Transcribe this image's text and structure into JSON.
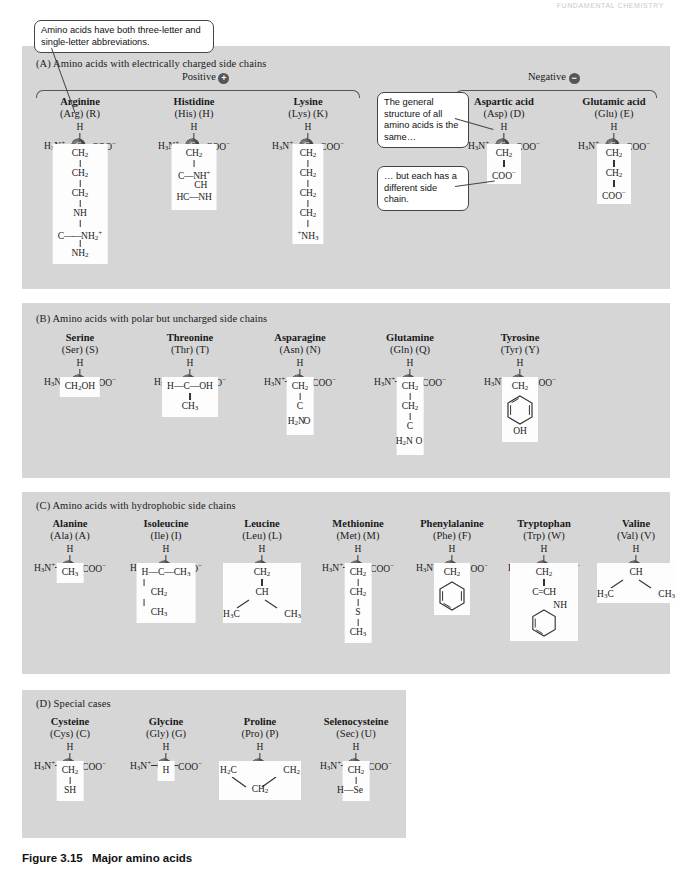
{
  "header": {
    "running_head": "FUNDAMENTAL CHEMISTRY"
  },
  "caption": {
    "label": "Figure 3.15",
    "title": "Major amino acids"
  },
  "callouts": [
    {
      "id": "abbrev-callout",
      "text": "Amino acids have both three-letter and single-letter abbreviations."
    },
    {
      "id": "general-structure-callout",
      "text": "The general structure of all amino acids is the same…"
    },
    {
      "id": "side-chain-callout",
      "text": "… but each has a different side chain."
    }
  ],
  "sections": [
    {
      "id": "A",
      "label": "(A)  Amino acids with electrically charged side chains",
      "charge_groups": [
        {
          "label": "Positive",
          "symbol": "+"
        },
        {
          "label": "Negative",
          "symbol": "−"
        }
      ],
      "amino_acids": [
        {
          "name": "Arginine",
          "three": "(Arg)",
          "one": "(R)",
          "amino": "H3N+",
          "carboxyl": "COO-",
          "side_chain": [
            "CH2",
            "CH2",
            "CH2",
            "NH",
            "C=NH2+",
            "NH2"
          ]
        },
        {
          "name": "Histidine",
          "three": "(His)",
          "one": "(H)",
          "amino": "H3N+",
          "carboxyl": "COO-",
          "side_chain": [
            "CH2",
            "C—NH+",
            "CH",
            "HC—NH"
          ]
        },
        {
          "name": "Lysine",
          "three": "(Lys)",
          "one": "(K)",
          "amino": "H3N+",
          "carboxyl": "COO-",
          "side_chain": [
            "CH2",
            "CH2",
            "CH2",
            "CH2",
            "+NH3"
          ]
        },
        {
          "name": "Aspartic acid",
          "three": "(Asp)",
          "one": "(D)",
          "amino": "H3N+",
          "carboxyl": "COO-",
          "side_chain": [
            "CH2",
            "COO-"
          ]
        },
        {
          "name": "Glutamic acid",
          "three": "(Glu)",
          "one": "(E)",
          "amino": "H3N+",
          "carboxyl": "COO-",
          "side_chain": [
            "CH2",
            "CH2",
            "COO-"
          ]
        }
      ]
    },
    {
      "id": "B",
      "label": "(B)  Amino acids with polar but uncharged side chains",
      "amino_acids": [
        {
          "name": "Serine",
          "three": "(Ser)",
          "one": "(S)",
          "amino": "H3N+",
          "carboxyl": "COO-",
          "side_chain": [
            "CH2OH"
          ]
        },
        {
          "name": "Threonine",
          "three": "(Thr)",
          "one": "(T)",
          "amino": "H3N+",
          "carboxyl": "COO-",
          "side_chain": [
            "H—C—OH",
            "CH3"
          ]
        },
        {
          "name": "Asparagine",
          "three": "(Asn)",
          "one": "(N)",
          "amino": "H3N+",
          "carboxyl": "COO-",
          "side_chain": [
            "CH2",
            "C",
            "H2N",
            "O"
          ]
        },
        {
          "name": "Glutamine",
          "three": "(Gln)",
          "one": "(Q)",
          "amino": "H3N+",
          "carboxyl": "COO-",
          "side_chain": [
            "CH2",
            "CH2",
            "C",
            "H2N",
            "O"
          ]
        },
        {
          "name": "Tyrosine",
          "three": "(Tyr)",
          "one": "(Y)",
          "amino": "H3N+",
          "carboxyl": "COO-",
          "side_chain": [
            "CH2",
            "benzene-ring",
            "OH"
          ]
        }
      ]
    },
    {
      "id": "C",
      "label": "(C)  Amino acids with hydrophobic side chains",
      "amino_acids": [
        {
          "name": "Alanine",
          "three": "(Ala)",
          "one": "(A)",
          "amino": "H3N+",
          "carboxyl": "COO-",
          "side_chain": [
            "CH3"
          ]
        },
        {
          "name": "Isoleucine",
          "three": "(Ile)",
          "one": "(I)",
          "amino": "H3N+",
          "carboxyl": "COO-",
          "side_chain": [
            "H—C—CH3",
            "CH2",
            "CH3"
          ]
        },
        {
          "name": "Leucine",
          "three": "(Leu)",
          "one": "(L)",
          "amino": "H3N+",
          "carboxyl": "COO-",
          "side_chain": [
            "CH2",
            "CH",
            "H3C",
            "CH3"
          ]
        },
        {
          "name": "Methionine",
          "three": "(Met)",
          "one": "(M)",
          "amino": "H3N+",
          "carboxyl": "COO-",
          "side_chain": [
            "CH2",
            "CH2",
            "S",
            "CH3"
          ]
        },
        {
          "name": "Phenylalanine",
          "three": "(Phe)",
          "one": "(F)",
          "amino": "H3N+",
          "carboxyl": "COO-",
          "side_chain": [
            "CH2",
            "benzene-ring"
          ]
        },
        {
          "name": "Tryptophan",
          "three": "(Trp)",
          "one": "(W)",
          "amino": "H3N+",
          "carboxyl": "COO-",
          "side_chain": [
            "CH2",
            "C=CH",
            "NH",
            "benzene-ring"
          ]
        },
        {
          "name": "Valine",
          "three": "(Val)",
          "one": "(V)",
          "amino": "H3N+",
          "carboxyl": "COO-",
          "side_chain": [
            "CH",
            "H3C",
            "CH3"
          ]
        }
      ]
    },
    {
      "id": "D",
      "label": "(D)  Special cases",
      "amino_acids": [
        {
          "name": "Cysteine",
          "three": "(Cys)",
          "one": "(C)",
          "amino": "H3N+",
          "carboxyl": "COO-",
          "side_chain": [
            "CH2",
            "SH"
          ]
        },
        {
          "name": "Glycine",
          "three": "(Gly)",
          "one": "(G)",
          "amino": "H3N+",
          "carboxyl": "COO-",
          "side_chain": [
            "H"
          ]
        },
        {
          "name": "Proline",
          "three": "(Pro)",
          "one": "(P)",
          "amino": "H2N+",
          "carboxyl": "COO-",
          "side_chain": [
            "H2C",
            "CH2",
            "CH2"
          ]
        },
        {
          "name": "Selenocysteine",
          "three": "(Sec)",
          "one": "(U)",
          "amino": "H3N+",
          "carboxyl": "COO-",
          "side_chain": [
            "CH2",
            "H—Se"
          ]
        }
      ]
    }
  ],
  "labels": {
    "alpha_carbon": "C",
    "h_top": "H"
  },
  "colors": {
    "panel": "#d6d6d6",
    "side_chain_box": "#fdfdfd",
    "bond": "#333333",
    "alpha_carbon": "#1d1d1d"
  }
}
